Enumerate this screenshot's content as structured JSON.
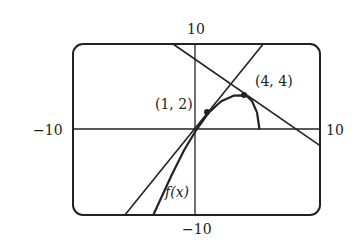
{
  "chart_data": {
    "type": "line",
    "title": "",
    "xlabel": "",
    "ylabel": "",
    "xlim": [
      -10,
      10
    ],
    "ylim": [
      -10,
      10
    ],
    "grid": false,
    "tick_labels": {
      "x_min": "−10",
      "x_max": "10",
      "y_min": "−10",
      "y_max": "10"
    },
    "series": [
      {
        "name": "f(x)",
        "points": [
          [
            -3.5,
            -10
          ],
          [
            -2,
            -5.3
          ],
          [
            -1,
            -2.4
          ],
          [
            0,
            0
          ],
          [
            1,
            2
          ],
          [
            2,
            3.3
          ],
          [
            3,
            3.95
          ],
          [
            4,
            4
          ],
          [
            4.5,
            3.3
          ],
          [
            4.9,
            2
          ],
          [
            5.1,
            0
          ]
        ]
      },
      {
        "name": "tangent at (1,2)",
        "points": [
          [
            -5.8,
            -10
          ],
          [
            5.4,
            10
          ]
        ]
      },
      {
        "name": "line through (4,4)",
        "points": [
          [
            -1.9,
            10
          ],
          [
            10,
            -1.9
          ]
        ]
      }
    ],
    "annotations": [
      {
        "text": "(1, 2)",
        "x": 1,
        "y": 2
      },
      {
        "text": "(4, 4)",
        "x": 4,
        "y": 4
      },
      {
        "text": "f(x)",
        "x": -2.5,
        "y": -8
      }
    ]
  }
}
